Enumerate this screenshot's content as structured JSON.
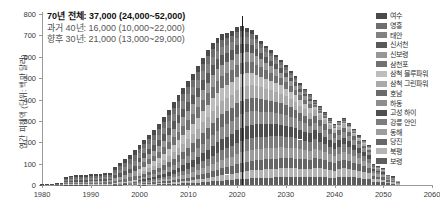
{
  "chart_data": {
    "type": "bar",
    "stacked": true,
    "title": "",
    "xlabel": "",
    "ylabel": "연간 피해액 (단위: 백만 달러)",
    "xlim": [
      1980,
      2060
    ],
    "ylim": [
      0,
      800
    ],
    "ytick_step": 100,
    "xtick_step": 10,
    "yticks": [
      0,
      100,
      200,
      300,
      400,
      500,
      600,
      700,
      800
    ],
    "xticks": [
      1980,
      1990,
      2000,
      2010,
      2020,
      2030,
      2040,
      2050,
      2060
    ],
    "grid": false,
    "legend_position": "right",
    "divider_year": 2021,
    "series": [
      {
        "name": "여수",
        "color": "#4a4a4a"
      },
      {
        "name": "영흥",
        "color": "#6e6e6e"
      },
      {
        "name": "태안",
        "color": "#828282"
      },
      {
        "name": "신서천",
        "color": "#5a5a5a"
      },
      {
        "name": "신보령",
        "color": "#979797"
      },
      {
        "name": "삼천포",
        "color": "#717171"
      },
      {
        "name": "삼척 블루파워",
        "color": "#bdbdbd"
      },
      {
        "name": "삼척 그린파워",
        "color": "#aaaaaa"
      },
      {
        "name": "호남",
        "color": "#6a6a6a"
      },
      {
        "name": "하동",
        "color": "#8d8d8d"
      },
      {
        "name": "고성 하이",
        "color": "#4f4f4f"
      },
      {
        "name": "강릉 안인",
        "color": "#7d7d7d"
      },
      {
        "name": "동해",
        "color": "#9d9d9d"
      },
      {
        "name": "당진",
        "color": "#666666"
      },
      {
        "name": "북평",
        "color": "#b4b4b4"
      },
      {
        "name": "보령",
        "color": "#5e5e5e"
      }
    ],
    "x": [
      1980,
      1981,
      1982,
      1983,
      1984,
      1985,
      1986,
      1987,
      1988,
      1989,
      1990,
      1991,
      1992,
      1993,
      1994,
      1995,
      1996,
      1997,
      1998,
      1999,
      2000,
      2001,
      2002,
      2003,
      2004,
      2005,
      2006,
      2007,
      2008,
      2009,
      2010,
      2011,
      2012,
      2013,
      2014,
      2015,
      2016,
      2017,
      2018,
      2019,
      2020,
      2021,
      2022,
      2023,
      2024,
      2025,
      2026,
      2027,
      2028,
      2029,
      2030,
      2031,
      2032,
      2033,
      2034,
      2035,
      2036,
      2037,
      2038,
      2039,
      2040,
      2041,
      2042,
      2043,
      2044,
      2045,
      2046,
      2047,
      2048,
      2049,
      2050,
      2051,
      2052,
      2053
    ],
    "totals": [
      5,
      6,
      7,
      8,
      10,
      38,
      44,
      46,
      47,
      48,
      50,
      50,
      52,
      54,
      58,
      86,
      104,
      120,
      140,
      162,
      186,
      212,
      236,
      258,
      284,
      318,
      352,
      388,
      420,
      452,
      486,
      520,
      556,
      596,
      630,
      664,
      690,
      706,
      712,
      720,
      740,
      742,
      736,
      724,
      700,
      676,
      652,
      630,
      608,
      586,
      560,
      534,
      508,
      476,
      450,
      424,
      396,
      368,
      340,
      312,
      286,
      300,
      312,
      288,
      262,
      236,
      210,
      186,
      100,
      88,
      78,
      46,
      40,
      18
    ]
  },
  "annotation": {
    "line1": "70년 전체: 37,000 (24,000~52,000)",
    "line2": "과거 40년: 16,000 (10,000~22,000)",
    "line3": "향후 30년: 21,000 (13,000~29,000)"
  }
}
